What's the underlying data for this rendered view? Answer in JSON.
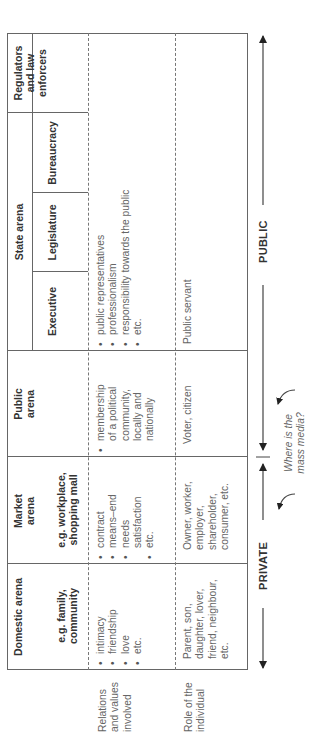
{
  "diagram": {
    "row_labels": {
      "relations": "Relations and values involved",
      "role": "Role of the individual"
    },
    "columns": {
      "domestic": {
        "title": "Domestic arena",
        "example": "e.g. family, community",
        "relations": [
          "intimacy",
          "friendship",
          "love",
          "etc."
        ],
        "role": "Parent, son, daughter, lover, friend, neighbour, etc."
      },
      "market": {
        "title": "Market arena",
        "example": "e.g. workplace, shopping mall",
        "relations": [
          "contract",
          "means–end",
          "needs satisfaction",
          "etc."
        ],
        "role": "Owner, worker, employer, shareholder, consumer, etc."
      },
      "public": {
        "title": "Public arena",
        "relations": [
          "membership of a political community, locally and nationally"
        ],
        "role": "Voter, citizen"
      },
      "state": {
        "title": "State arena",
        "subcolumns": [
          "Executive",
          "Legislature",
          "Bureaucracy",
          "Regulators and law enforcers"
        ],
        "relations": [
          "public representatives",
          "professionalism",
          "responsibility towards the public",
          "etc."
        ],
        "role": "Public servant"
      }
    },
    "axis": {
      "private_label": "PRIVATE",
      "public_label": "PUBLIC",
      "media_question": "Where is the mass media?"
    }
  }
}
